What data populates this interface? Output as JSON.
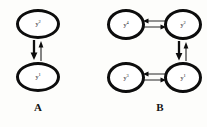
{
  "figure": {
    "background_color": "#fdfdfb",
    "stroke_color": "#0d0d0d",
    "panels": [
      {
        "id": "A",
        "caption": "A",
        "nodes": [
          {
            "id": "a-y2",
            "base": "y",
            "superscript": "2",
            "label": "y2",
            "position": "top"
          },
          {
            "id": "a-y1",
            "base": "y",
            "superscript": "1",
            "label": "y1",
            "position": "bottom"
          }
        ],
        "edges": [
          {
            "id": "a-down",
            "from": "a-y2",
            "to": "a-y1",
            "direction": "down",
            "weight": "thick"
          },
          {
            "id": "a-up",
            "from": "a-y1",
            "to": "a-y2",
            "direction": "up",
            "weight": "thin"
          }
        ]
      },
      {
        "id": "B",
        "caption": "B",
        "nodes": [
          {
            "id": "b-y4",
            "base": "y",
            "superscript": "4",
            "label": "y4",
            "position": "top-left"
          },
          {
            "id": "b-y2",
            "base": "y",
            "superscript": "2",
            "label": "y2",
            "position": "top-right"
          },
          {
            "id": "b-y3",
            "base": "y",
            "superscript": "3",
            "label": "y3",
            "position": "bottom-left"
          },
          {
            "id": "b-y1",
            "base": "y",
            "superscript": "1",
            "label": "y1",
            "position": "bottom-right"
          }
        ],
        "edges": [
          {
            "id": "b-top-right",
            "from": "b-y4",
            "to": "b-y2",
            "direction": "right",
            "weight": "thin"
          },
          {
            "id": "b-top-left",
            "from": "b-y2",
            "to": "b-y4",
            "direction": "left",
            "weight": "thin"
          },
          {
            "id": "b-bottom-right",
            "from": "b-y3",
            "to": "b-y1",
            "direction": "right",
            "weight": "thin"
          },
          {
            "id": "b-bottom-left",
            "from": "b-y1",
            "to": "b-y3",
            "direction": "left",
            "weight": "thin"
          },
          {
            "id": "b-down",
            "from": "b-y2",
            "to": "b-y1",
            "direction": "down",
            "weight": "thick"
          },
          {
            "id": "b-up",
            "from": "b-y1",
            "to": "b-y2",
            "direction": "up",
            "weight": "thin"
          }
        ]
      }
    ]
  }
}
